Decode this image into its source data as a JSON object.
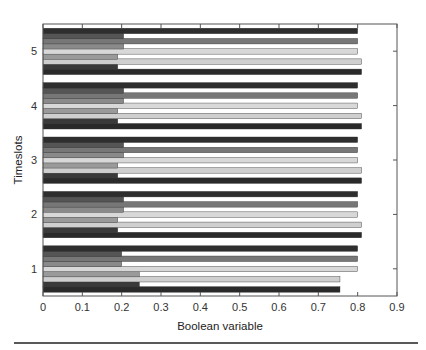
{
  "chart_data": {
    "type": "bar",
    "orientation": "horizontal",
    "title": "",
    "xlabel": "Boolean variable",
    "ylabel": "Timeslots",
    "xlim": [
      0,
      0.9
    ],
    "xticks": [
      "0",
      "0.1",
      "0.2",
      "0.3",
      "0.4",
      "0.5",
      "0.6",
      "0.7",
      "0.8",
      "0.9"
    ],
    "categories": [
      "1",
      "2",
      "3",
      "4",
      "5"
    ],
    "grid": false,
    "legend": null,
    "series": [
      {
        "name": "bar-1",
        "color": "#2a2a2a",
        "values": [
          0.755,
          0.81,
          0.81,
          0.81,
          0.81
        ]
      },
      {
        "name": "bar-2",
        "color": "#3a3a3a",
        "values": [
          0.245,
          0.19,
          0.19,
          0.19,
          0.19
        ]
      },
      {
        "name": "bar-3",
        "color": "#cfcfcf",
        "values": [
          0.755,
          0.81,
          0.81,
          0.81,
          0.81
        ]
      },
      {
        "name": "bar-4",
        "color": "#9a9a9a",
        "values": [
          0.245,
          0.19,
          0.19,
          0.19,
          0.19
        ]
      },
      {
        "name": "bar-5",
        "color": "#d8d8d8",
        "values": [
          0.8,
          0.8,
          0.8,
          0.8,
          0.8
        ]
      },
      {
        "name": "bar-6",
        "color": "#8a8a8a",
        "values": [
          0.2,
          0.205,
          0.205,
          0.205,
          0.205
        ]
      },
      {
        "name": "bar-7",
        "color": "#777777",
        "values": [
          0.8,
          0.8,
          0.8,
          0.8,
          0.8
        ]
      },
      {
        "name": "bar-8",
        "color": "#555555",
        "values": [
          0.2,
          0.205,
          0.205,
          0.205,
          0.205
        ]
      },
      {
        "name": "bar-9",
        "color": "#2e2e2e",
        "values": [
          0.8,
          0.8,
          0.8,
          0.8,
          0.8
        ]
      }
    ]
  }
}
